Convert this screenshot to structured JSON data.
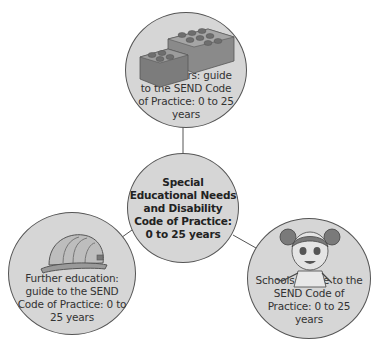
{
  "diagram": {
    "center": {
      "label": "Special Educational Needs and Disability Code of Practice: 0 to 25 years"
    },
    "nodes": [
      {
        "id": "top",
        "label": "Early years: guide to the SEND Code of Practice: 0 to 25 years",
        "icon": "lego-bricks-icon"
      },
      {
        "id": "left",
        "label": "Further education: guide to the SEND Code of Practice: 0 to 25 years",
        "icon": "hard-hat-icon"
      },
      {
        "id": "right",
        "label": "Schools: guide to the SEND Code of Practice: 0 to 25 years",
        "icon": "girl-character-icon"
      }
    ],
    "colors": {
      "circle_fill": "#d6d6d6",
      "circle_stroke": "#555555",
      "connector": "#555555"
    }
  }
}
